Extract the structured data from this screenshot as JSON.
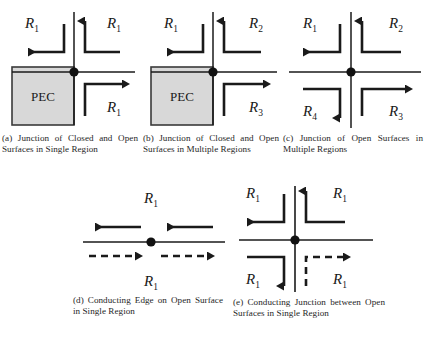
{
  "figure": {
    "panel_count": 5,
    "colors": {
      "ink": "#1a1a1a",
      "pec_fill": "#d8d8d8",
      "pec_stroke": "#3a3a3a",
      "background": "#ffffff"
    }
  },
  "panels": [
    {
      "id": "a",
      "caption": "(a) Junction of Closed and Open Surfaces in Single Region",
      "region_block": {
        "label": "PEC",
        "present": true
      },
      "region_labels": [
        {
          "text": "R",
          "sub": "1",
          "position": "upper-left"
        },
        {
          "text": "R",
          "sub": "1",
          "position": "upper-right"
        },
        {
          "text": "R",
          "sub": "1",
          "position": "lower-right"
        }
      ],
      "arrows": [
        {
          "direction": "left",
          "quadrant": "upper-left",
          "style": "solid"
        },
        {
          "direction": "up",
          "quadrant": "upper-right",
          "style": "solid"
        },
        {
          "direction": "right",
          "quadrant": "lower-right",
          "style": "solid"
        }
      ],
      "junction_node": true
    },
    {
      "id": "b",
      "caption": "(b) Junction of Closed and Open Surfaces in Multiple Regions",
      "region_block": {
        "label": "PEC",
        "present": true
      },
      "region_labels": [
        {
          "text": "R",
          "sub": "1",
          "position": "upper-left"
        },
        {
          "text": "R",
          "sub": "2",
          "position": "upper-right"
        },
        {
          "text": "R",
          "sub": "3",
          "position": "lower-right"
        }
      ],
      "arrows": [
        {
          "direction": "left",
          "quadrant": "upper-left",
          "style": "solid"
        },
        {
          "direction": "up",
          "quadrant": "upper-right",
          "style": "solid"
        },
        {
          "direction": "right",
          "quadrant": "lower-right",
          "style": "solid"
        }
      ],
      "junction_node": true
    },
    {
      "id": "c",
      "caption": "(c) Junction of Open Surfaces in Multiple Regions",
      "region_block": {
        "label": "",
        "present": false
      },
      "region_labels": [
        {
          "text": "R",
          "sub": "1",
          "position": "upper-left"
        },
        {
          "text": "R",
          "sub": "2",
          "position": "upper-right"
        },
        {
          "text": "R",
          "sub": "3",
          "position": "lower-right"
        },
        {
          "text": "R",
          "sub": "4",
          "position": "lower-left"
        }
      ],
      "arrows": [
        {
          "direction": "left",
          "quadrant": "upper-left",
          "style": "solid"
        },
        {
          "direction": "up",
          "quadrant": "upper-right",
          "style": "solid"
        },
        {
          "direction": "right",
          "quadrant": "lower-right",
          "style": "solid"
        },
        {
          "direction": "down",
          "quadrant": "lower-left",
          "style": "solid"
        }
      ],
      "junction_node": true
    },
    {
      "id": "d",
      "caption": "(d) Conducting Edge on Open Surface in Single Region",
      "region_block": {
        "label": "",
        "present": false
      },
      "region_labels": [
        {
          "text": "R",
          "sub": "1",
          "position": "above"
        },
        {
          "text": "R",
          "sub": "1",
          "position": "below"
        }
      ],
      "arrows": [
        {
          "direction": "left",
          "quadrant": "above-left",
          "style": "solid"
        },
        {
          "direction": "left",
          "quadrant": "above-right",
          "style": "solid"
        },
        {
          "direction": "right",
          "quadrant": "below-left",
          "style": "dashed"
        },
        {
          "direction": "right",
          "quadrant": "below-right",
          "style": "dashed"
        }
      ],
      "junction_node": true
    },
    {
      "id": "e",
      "caption": "(e) Conducting Junction between Open Surfaces in Single Region",
      "region_block": {
        "label": "",
        "present": false
      },
      "region_labels": [
        {
          "text": "R",
          "sub": "1",
          "position": "upper-left"
        },
        {
          "text": "R",
          "sub": "1",
          "position": "upper-right"
        },
        {
          "text": "R",
          "sub": "1",
          "position": "lower-right"
        },
        {
          "text": "R",
          "sub": "1",
          "position": "lower-left"
        }
      ],
      "arrows": [
        {
          "direction": "left",
          "quadrant": "upper-left",
          "style": "solid"
        },
        {
          "direction": "up",
          "quadrant": "upper-right",
          "style": "solid"
        },
        {
          "direction": "right",
          "quadrant": "lower-right",
          "style": "dashed"
        },
        {
          "direction": "down",
          "quadrant": "lower-left",
          "style": "solid"
        }
      ],
      "junction_node": true
    }
  ]
}
